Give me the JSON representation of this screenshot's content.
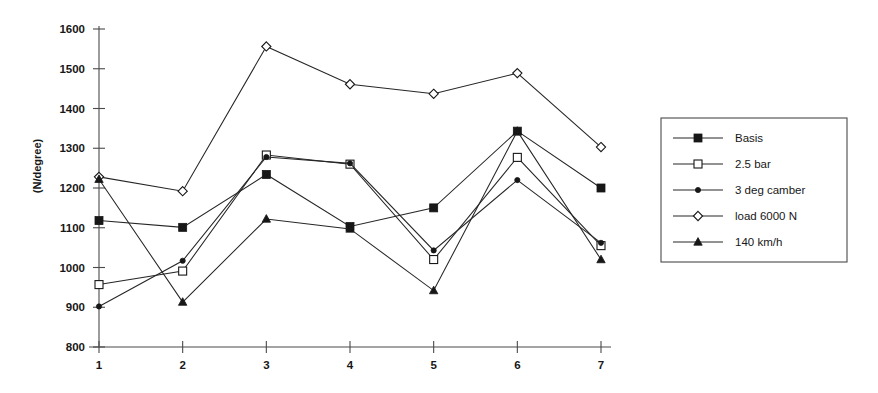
{
  "chart_data": {
    "type": "line",
    "title": "",
    "xlabel": "",
    "ylabel": "(N/degree)",
    "x": [
      1,
      2,
      3,
      4,
      5,
      6,
      7
    ],
    "xtick_labels": [
      "1",
      "2",
      "3",
      "4",
      "5",
      "6",
      "7"
    ],
    "ytick_labels": [
      "800",
      "900",
      "1000",
      "1100",
      "1200",
      "1300",
      "1400",
      "1500",
      "1600"
    ],
    "ytick_values": [
      800,
      900,
      1000,
      1100,
      1200,
      1300,
      1400,
      1500,
      1600
    ],
    "ylim": [
      800,
      1600
    ],
    "xlim": [
      1,
      7
    ],
    "grid": false,
    "legend_position": "right-outside",
    "series": [
      {
        "name": "Basis",
        "marker": "filled-square",
        "values": [
          1118,
          1101,
          1234,
          1103,
          1150,
          1343,
          1200
        ]
      },
      {
        "name": "2.5 bar",
        "marker": "open-square",
        "values": [
          957,
          991,
          1283,
          1260,
          1020,
          1277,
          1055
        ]
      },
      {
        "name": "3 deg camber",
        "marker": "filled-circle",
        "values": [
          902,
          1017,
          1278,
          1262,
          1043,
          1220,
          1062
        ]
      },
      {
        "name": "load 6000 N",
        "marker": "open-diamond",
        "values": [
          1228,
          1192,
          1556,
          1461,
          1437,
          1489,
          1303
        ]
      },
      {
        "name": "140 km/h",
        "marker": "filled-triangle",
        "values": [
          1222,
          913,
          1122,
          1097,
          942,
          1343,
          1020
        ]
      }
    ]
  },
  "legend": {
    "entries": [
      {
        "label": "Basis",
        "marker": "filled-square"
      },
      {
        "label": "2.5 bar",
        "marker": "open-square"
      },
      {
        "label": "3 deg camber",
        "marker": "filled-circle"
      },
      {
        "label": "load 6000 N",
        "marker": "open-diamond"
      },
      {
        "label": "140 km/h",
        "marker": "filled-triangle"
      }
    ]
  }
}
